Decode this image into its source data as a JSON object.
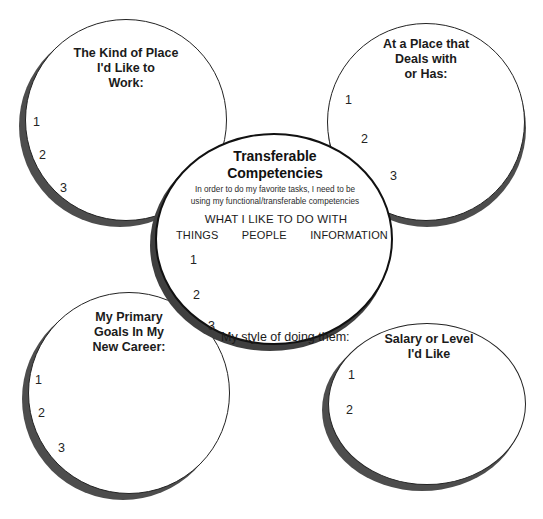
{
  "diagram": {
    "colors": {
      "outline": "#232323",
      "center_outline": "#111111",
      "shadow": "#4d4d4d",
      "background": "#ffffff",
      "text": "#1b1b1b"
    }
  },
  "center": {
    "title": "Transferable\nCompetencies",
    "subtitle": "In order to do my favorite tasks, I need to be\nusing my functional/transferable competencies",
    "what_heading": "WHAT I LIKE TO DO WITH",
    "columns": [
      "THINGS",
      "PEOPLE",
      "INFORMATION"
    ],
    "items": [
      "1",
      "2",
      "3"
    ],
    "style_label": "My style of doing them:"
  },
  "petals": [
    {
      "id": "kind-of-place",
      "title": "The Kind of Place\nI'd Like to\nWork:",
      "items": [
        "1",
        "2",
        "3"
      ]
    },
    {
      "id": "place-deals-with",
      "title": "At a Place that\nDeals with\nor Has:",
      "items": [
        "1",
        "2",
        "3"
      ]
    },
    {
      "id": "primary-goals",
      "title": "My Primary\nGoals In My\nNew Career:",
      "items": [
        "1",
        "2",
        "3"
      ]
    },
    {
      "id": "salary-or-level",
      "title": "Salary or Level\nI'd Like",
      "items": [
        "1",
        "2"
      ]
    }
  ]
}
